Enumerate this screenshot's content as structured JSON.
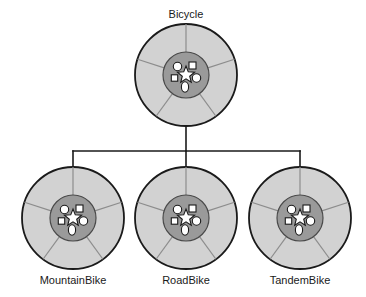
{
  "diagram": {
    "type": "class-inheritance-tree",
    "background_color": "#ffffff",
    "parent": {
      "id": "bicycle",
      "label": "Bicycle",
      "label_x": 186,
      "label_y": 18,
      "center_x": 186,
      "center_y": 75,
      "outer_radius": 51,
      "hub_radius": 23
    },
    "children": [
      {
        "id": "mountainbike",
        "label": "MountainBike",
        "label_x": 73,
        "label_y": 284,
        "center_x": 73,
        "center_y": 218,
        "outer_radius": 51,
        "hub_radius": 23
      },
      {
        "id": "roadbike",
        "label": "RoadBike",
        "label_x": 186,
        "label_y": 284,
        "center_x": 186,
        "center_y": 218,
        "outer_radius": 51,
        "hub_radius": 23
      },
      {
        "id": "tandembike",
        "label": "TandemBike",
        "label_x": 300,
        "label_y": 284,
        "center_x": 300,
        "center_y": 218,
        "outer_radius": 51,
        "hub_radius": 23
      }
    ],
    "connector": {
      "stem_x": 186,
      "stem_top_y": 126,
      "bus_y": 151,
      "bus_left_x": 73,
      "bus_right_x": 300,
      "drop_bottom_y": 170,
      "stroke_color": "#1a1a1a",
      "stroke_width": 1.6
    },
    "wheel_style": {
      "rim_fill": "#d2d2d2",
      "rim_stroke": "#1a1a1a",
      "rim_stroke_width": 1.8,
      "hub_fill": "#9a9a9a",
      "hub_stroke": "#4a4a4a",
      "hub_stroke_width": 1.2,
      "spoke_color": "#8d8d8d",
      "spoke_width": 1.2,
      "shape_fill": "#ffffff",
      "shape_stroke": "#1a1a1a",
      "shape_stroke_width": 1.1,
      "spoke_angles_deg": [
        90,
        162,
        234,
        306,
        18
      ]
    },
    "hub_shapes": [
      {
        "name": "circle-upper-left",
        "kind": "circle",
        "dx": -8.5,
        "dy": -8.5,
        "r": 4.2
      },
      {
        "name": "square-upper-right",
        "kind": "square",
        "dx": 6.5,
        "dy": -9.5,
        "size": 7.0
      },
      {
        "name": "square-left",
        "kind": "square",
        "dx": -11.5,
        "dy": 3.0,
        "size": 6.4
      },
      {
        "name": "circle-right",
        "kind": "circle",
        "dx": 10.5,
        "dy": 3.0,
        "r": 4.2
      },
      {
        "name": "ellipse-bottom",
        "kind": "ellipse",
        "dx": -1.0,
        "dy": 12.0,
        "rx": 3.6,
        "ry": 5.2
      },
      {
        "name": "star-center",
        "kind": "star",
        "dx": 0.0,
        "dy": 0.0,
        "outer_r": 9.0,
        "inner_r": 3.9
      }
    ]
  }
}
